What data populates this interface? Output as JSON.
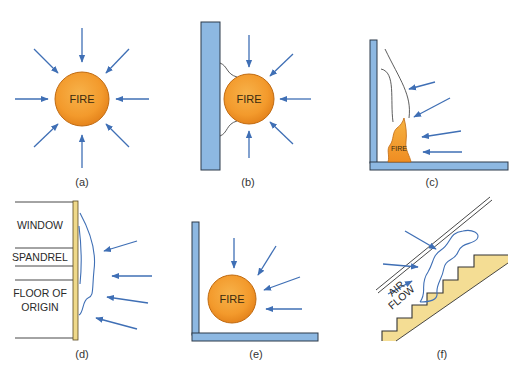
{
  "figure": {
    "panels": [
      {
        "id": "a",
        "caption": "(a)",
        "fire_label": "FIRE",
        "description": "Fire in open, air drawn equally from all sides"
      },
      {
        "id": "b",
        "caption": "(b)",
        "fire_label": "FIRE",
        "description": "Fire against a wall"
      },
      {
        "id": "c",
        "caption": "(c)",
        "fire_label": "FIRE",
        "description": "Fire in corner, flame drawn up wall"
      },
      {
        "id": "d",
        "caption": "(d)",
        "labels": [
          "WINDOW",
          "SPANDREL",
          "FLOOR OF",
          "ORIGIN"
        ],
        "description": "Flame on building exterior"
      },
      {
        "id": "e",
        "caption": "(e)",
        "fire_label": "FIRE",
        "description": "Fire in corner"
      },
      {
        "id": "f",
        "caption": "(f)",
        "labels": [
          "AIR",
          "FLOW"
        ],
        "description": "Fire on stairway"
      }
    ]
  },
  "colors": {
    "arrow": "#3f6fb5",
    "fire_fill": "#f39a2c",
    "fire_edge": "#c06a10",
    "wall_fill": "#8db8e2",
    "wall_edge": "#2d3a4a",
    "spandrel_wall": "#efd98a",
    "stairs": "#f4dd94",
    "flame_line": "#3f6fb5"
  }
}
